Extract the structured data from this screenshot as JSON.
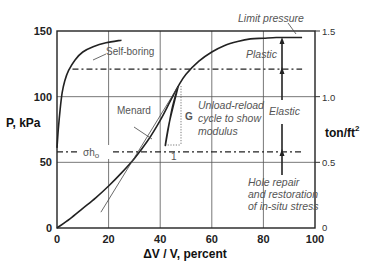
{
  "chart_data": {
    "type": "line",
    "title": "",
    "xlabel": "ΔV / V, percent",
    "ylabel": "P, kPa",
    "ylabel_right": "ton/ft",
    "ylabel_right_sup": "2",
    "xlim": [
      0,
      100
    ],
    "ylim": [
      0,
      150
    ],
    "ylim_right": [
      0,
      1.5
    ],
    "grid": true,
    "x_ticks": [
      "0",
      "20",
      "40",
      "60",
      "80",
      "100"
    ],
    "y_ticks": [
      "0",
      "50",
      "100",
      "150"
    ],
    "y_ticks_right": [
      "0",
      "0.5",
      "1.0",
      "1.5"
    ],
    "series": [
      {
        "name": "Self-boring",
        "x": [
          0,
          0.5,
          1.2,
          2,
          3,
          4.5,
          7,
          10,
          14,
          19,
          25
        ],
        "y": [
          61,
          75,
          90,
          103,
          112,
          120,
          128,
          134,
          138,
          141,
          143
        ]
      },
      {
        "name": "Menard",
        "x": [
          0,
          5,
          10,
          15,
          20,
          25,
          30,
          35,
          40,
          44,
          47,
          50,
          55,
          60,
          65,
          70,
          75,
          80,
          85,
          90,
          95
        ],
        "y": [
          0,
          7,
          15,
          23,
          32,
          42,
          53,
          66,
          82,
          97,
          108,
          117,
          127,
          134,
          139,
          142,
          144,
          144.5,
          145,
          145,
          145
        ]
      },
      {
        "name": "Unload-reload cycle",
        "x": [
          47,
          44.5,
          42,
          43.5,
          47
        ],
        "y": [
          108,
          90,
          63,
          80,
          108
        ]
      },
      {
        "name": "Tangent (modulus)",
        "x": [
          17,
          47
        ],
        "y": [
          12,
          108
        ]
      }
    ],
    "reference_lines": [
      {
        "name": "Upper yield (dash-dot)",
        "y": 121,
        "x_range": [
          6,
          95
        ]
      },
      {
        "name": "σho (in-situ horizontal stress)",
        "y": 58,
        "x_range": [
          0,
          95
        ]
      }
    ],
    "annotations": [
      "Self-boring",
      "Menard",
      "Limit pressure",
      "Plastic",
      "Elastic",
      "Unload-reload cycle to show modulus",
      "G",
      "1",
      "σho",
      "Hole repair and restoration of in-situ stress"
    ]
  },
  "labels": {
    "self_boring": "Self-boring",
    "menard": "Menard",
    "limit_pressure": "Limit pressure",
    "plastic": "Plastic",
    "elastic": "Elastic",
    "unload_1": "Unload-reload",
    "unload_2": "cycle to show",
    "unload_3": "modulus",
    "g": "G",
    "one": "1",
    "sigma": "σh",
    "sigma_sub": "o",
    "hole_1": "Hole repair",
    "hole_2": "and restoration",
    "hole_3": "of in-situ stress"
  }
}
